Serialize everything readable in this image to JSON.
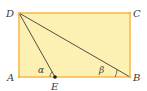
{
  "diagram": {
    "type": "geometry",
    "shape": "rectangle",
    "points": {
      "A": {
        "label": "A",
        "x": 19,
        "y": 77
      },
      "B": {
        "label": "B",
        "x": 130,
        "y": 77
      },
      "C": {
        "label": "C",
        "x": 130,
        "y": 13
      },
      "D": {
        "label": "D",
        "x": 19,
        "y": 13
      },
      "E": {
        "label": "E",
        "x": 55,
        "y": 77
      }
    },
    "segments": [
      "DE",
      "DB"
    ],
    "angles": [
      {
        "label": "α",
        "vertex": "E"
      },
      {
        "label": "β",
        "vertex": "B"
      }
    ],
    "colors": {
      "fill": "#fdf0b3",
      "border": "#f6b847",
      "line": "#3c3c3c"
    }
  }
}
